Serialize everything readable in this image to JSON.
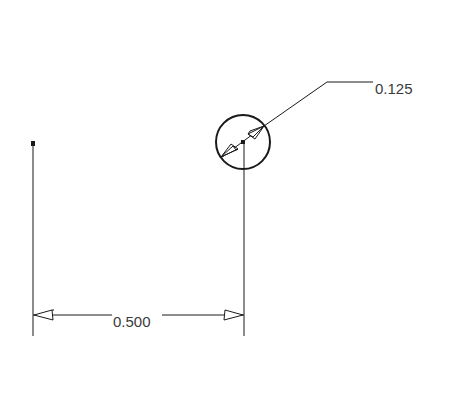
{
  "drawing": {
    "colors": {
      "line": "#1a1a1a",
      "text": "#3a3a3a",
      "background": "#ffffff"
    },
    "hole": {
      "cx": 243,
      "cy": 142,
      "r": 27
    },
    "point": {
      "x": 33,
      "y": 143
    },
    "dimensions": {
      "horizontal": {
        "label": "0.500",
        "x1": 33,
        "x2": 244,
        "y": 315
      },
      "diameter": {
        "label": "0.125",
        "leader_elbow_x": 327,
        "leader_elbow_y": 82,
        "leader_end_x": 373
      }
    }
  }
}
